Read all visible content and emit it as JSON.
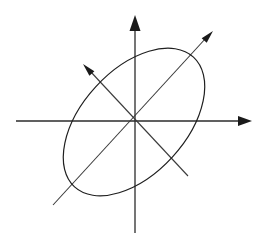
{
  "figure": {
    "background_color": "#ffffff",
    "width": 272,
    "height": 243,
    "origin": {
      "x": 135,
      "y": 121
    }
  },
  "style": {
    "axis_color": "#2b2b2b",
    "axis_stroke_width": 1.3,
    "diagonal_color": "#3a3a3a",
    "diagonal_stroke_width": 1.1,
    "ellipse_color": "#1f1f1f",
    "ellipse_stroke_width": 1.2,
    "arrow_fill": "#1a1a1a"
  },
  "axes": {
    "vertical": {
      "label": "y-axis",
      "x": 135,
      "y_start": 233,
      "y_end": 22,
      "arrow": {
        "tip_x": 135,
        "tip_y": 15,
        "half_width": 5.5,
        "length": 16
      }
    },
    "horizontal": {
      "label": "x-axis",
      "y": 121,
      "x_start": 16,
      "x_end": 243,
      "arrow": {
        "tip_x": 252,
        "tip_y": 121,
        "half_width": 5.0,
        "length": 14
      }
    }
  },
  "diagonals": [
    {
      "name": "major-axis-arrow",
      "label": "principal axis 1",
      "x1": 53,
      "y1": 205,
      "x2": 206,
      "y2": 38,
      "arrow": {
        "tip_x": 213,
        "tip_y": 31,
        "half_width": 3.4,
        "length": 13
      }
    },
    {
      "name": "minor-axis-arrow",
      "label": "principal axis 2",
      "x1": 188,
      "y1": 176,
      "x2": 90,
      "y2": 71,
      "arrow": {
        "tip_x": 83,
        "tip_y": 64,
        "half_width": 3.4,
        "length": 13
      }
    }
  ],
  "ellipse": {
    "label": "tilted ellipse",
    "center_x": 134,
    "center_y": 122,
    "semi_major": 88,
    "semi_minor": 52,
    "rotation_deg": -47.5
  },
  "chart_data": {
    "type": "scatter",
    "xlabel": "",
    "ylabel": "",
    "grid": false,
    "legend": "none",
    "annotations": [
      "ellipse centered at origin",
      "major axis arrow toward upper-right",
      "minor axis arrow toward upper-left",
      "cartesian axes with arrowheads"
    ],
    "series": [
      {
        "name": "ellipse",
        "shape": "ellipse",
        "center": [
          0,
          0
        ],
        "semi_major": 88,
        "semi_minor": 52,
        "rotation_deg": 47.5
      },
      {
        "name": "major-axis-arrow",
        "shape": "arrow",
        "from": [
          -82,
          -84
        ],
        "to": [
          78,
          90
        ]
      },
      {
        "name": "minor-axis-arrow",
        "shape": "arrow",
        "from": [
          53,
          -55
        ],
        "to": [
          -52,
          57
        ]
      }
    ]
  }
}
